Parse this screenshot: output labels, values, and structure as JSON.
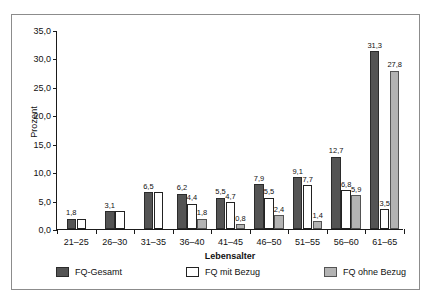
{
  "chart_data": {
    "type": "bar",
    "title": "",
    "xlabel": "Lebensalter",
    "ylabel": "Prozent",
    "ylim": [
      0,
      35
    ],
    "yticks": [
      "0,0",
      "5,0",
      "10,0",
      "15,0",
      "20,0",
      "25,0",
      "30,0",
      "35,0"
    ],
    "grid": false,
    "legend_position": "bottom",
    "categories": [
      "21–25",
      "26–30",
      "31–35",
      "36–40",
      "41–45",
      "46–50",
      "51–55",
      "56–60",
      "61–65"
    ],
    "series": [
      {
        "name": "FQ-Gesamt",
        "color": "#545454",
        "values": [
          1.8,
          3.1,
          6.5,
          6.2,
          5.5,
          7.9,
          9.1,
          12.7,
          31.3
        ],
        "labels": [
          "1,8",
          "3,1",
          "6,5",
          "6,2",
          "5,5",
          "7,9",
          "9,1",
          "12,7",
          "31,3"
        ]
      },
      {
        "name": "FQ mit Bezug",
        "color": "#ffffff",
        "values": [
          1.8,
          3.1,
          6.5,
          4.4,
          4.7,
          5.5,
          7.7,
          6.8,
          3.5
        ],
        "labels": [
          "",
          "",
          "",
          "4,4",
          "4,7",
          "5,5",
          "7,7",
          "6,8",
          "3,5"
        ]
      },
      {
        "name": "FQ ohne Bezug",
        "color": "#b3b3b3",
        "values": [
          null,
          null,
          null,
          1.8,
          0.8,
          2.4,
          1.4,
          5.9,
          27.8
        ],
        "labels": [
          "",
          "",
          "",
          "1,8",
          "0,8",
          "2,4",
          "1,4",
          "5,9",
          "27,8"
        ]
      }
    ]
  },
  "legend": {
    "items": [
      {
        "label": "FQ-Gesamt",
        "swatch": "s0"
      },
      {
        "label": "FQ mit Bezug",
        "swatch": "s1"
      },
      {
        "label": "FQ ohne Bezug",
        "swatch": "s2"
      }
    ]
  },
  "scan": {
    "top_sliver": ""
  }
}
